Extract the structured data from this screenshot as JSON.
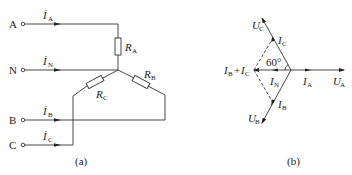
{
  "figure_a": {
    "caption": "(a)",
    "terminals": [
      {
        "name": "A",
        "current": "İ",
        "current_sub": "A"
      },
      {
        "name": "N",
        "current": "İ",
        "current_sub": "N"
      },
      {
        "name": "B",
        "current": "İ",
        "current_sub": "B"
      },
      {
        "name": "C",
        "current": "İ",
        "current_sub": "C"
      }
    ],
    "resistors": [
      {
        "label": "R",
        "sub": "A"
      },
      {
        "label": "R",
        "sub": "B"
      },
      {
        "label": "R",
        "sub": "C"
      }
    ]
  },
  "figure_b": {
    "caption": "(b)",
    "angle_label": "60°",
    "phasors": {
      "UA": {
        "label": "U",
        "sub": "A"
      },
      "UB": {
        "label": "U",
        "sub": "B"
      },
      "UC": {
        "label": "U",
        "sub": "C"
      },
      "IA": {
        "label": "I",
        "sub": "A"
      },
      "IB": {
        "label": "I",
        "sub": "B"
      },
      "IC": {
        "label": "I",
        "sub": "C"
      },
      "IN": {
        "label": "I",
        "sub": "N"
      },
      "IBC": {
        "label1": "I",
        "sub1": "B",
        "plus": "+",
        "label2": "I",
        "sub2": "C"
      }
    }
  },
  "colors": {
    "stroke": "#333333",
    "text": "#222222"
  }
}
